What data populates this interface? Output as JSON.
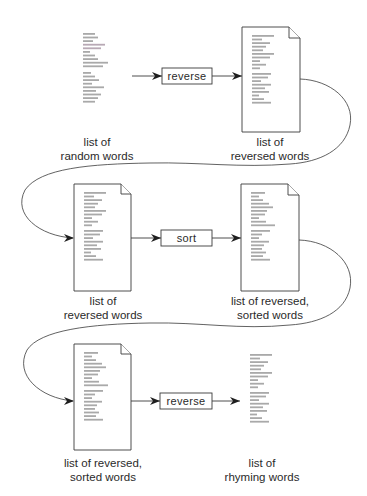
{
  "diagram": {
    "type": "process-flow",
    "rows": [
      {
        "input": {
          "label_line1": "list of",
          "label_line2": "random words",
          "is_file": false
        },
        "operation": {
          "label": "reverse"
        },
        "output": {
          "label_line1": "list of",
          "label_line2": "reversed words",
          "is_file": true
        }
      },
      {
        "input": {
          "label_line1": "list of",
          "label_line2": "reversed words",
          "is_file": true
        },
        "operation": {
          "label": "sort"
        },
        "output": {
          "label_line1": "list of reversed,",
          "label_line2": "sorted words",
          "is_file": true
        }
      },
      {
        "input": {
          "label_line1": "list of reversed,",
          "label_line2": "sorted words",
          "is_file": true
        },
        "operation": {
          "label": "reverse"
        },
        "output": {
          "label_line1": "list of",
          "label_line2": "rhyming words",
          "is_file": false
        }
      }
    ],
    "colors": {
      "stroke": "#3a3a3a",
      "bar": "#a9a9a9",
      "text": "#2a2a2a",
      "background": "#ffffff"
    }
  }
}
